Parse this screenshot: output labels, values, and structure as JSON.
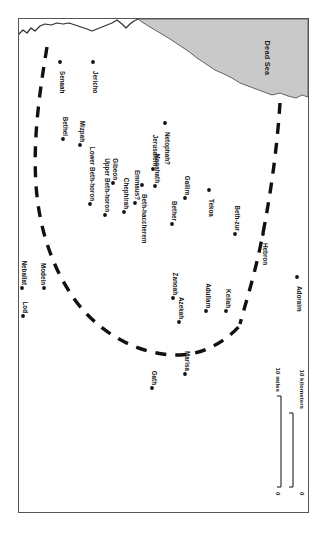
{
  "map": {
    "title": "Judah in the Persian Period",
    "orientation": "rotated-90-clockwise",
    "frame": {
      "stroke": "#4a4a4a",
      "fill": "#ffffff"
    },
    "water": {
      "name": "Dead Sea",
      "fill": "#c9c9c9",
      "stroke": "#555555"
    },
    "boundary": {
      "name": "provincial-boundary",
      "style": "dashed",
      "stroke": "#111111"
    },
    "sites": [
      {
        "name": "Senaah",
        "label": "Senaah",
        "x": 60,
        "y": 71,
        "dot_side": "right"
      },
      {
        "name": "Jericho",
        "label": "Jericho",
        "x": 93,
        "y": 73,
        "dot_side": "right"
      },
      {
        "name": "Bethel",
        "label": "Bethel",
        "x": 63,
        "y": 114,
        "dot_side": "left"
      },
      {
        "name": "Mizpah",
        "label": "Mizpah",
        "x": 80,
        "y": 117,
        "dot_side": "left"
      },
      {
        "name": "Lower Beth-horon",
        "label": "Lower Beth-horon",
        "x": 90,
        "y": 158,
        "dot_side": "left"
      },
      {
        "name": "Upper Beth-horon",
        "label": "Upper Beth-horon",
        "x": 105,
        "y": 164,
        "dot_side": "left"
      },
      {
        "name": "Gibeon",
        "label": "Gibeon",
        "x": 113,
        "y": 160,
        "dot_side": "left"
      },
      {
        "name": "Chephirah",
        "label": "Chephirah",
        "x": 124,
        "y": 173,
        "dot_side": "left"
      },
      {
        "name": "Emmaus?",
        "label": "Emmaus?",
        "x": 135,
        "y": 152,
        "dot_side": "left"
      },
      {
        "name": "Jerusalem",
        "label": "Jerusalem",
        "x": 153,
        "y": 140,
        "dot_side": "left"
      },
      {
        "name": "Manahath",
        "label": "Manahath",
        "x": 155,
        "y": 157,
        "dot_side": "left"
      },
      {
        "name": "Netophah?",
        "label": "Netophah?",
        "x": 165,
        "y": 132,
        "dot_side": "right"
      },
      {
        "name": "Beth-haccherem",
        "label": "Beth-haccherem",
        "x": 142,
        "y": 194,
        "dot_side": "right"
      },
      {
        "name": "Bether",
        "label": "Bether",
        "x": 172,
        "y": 196,
        "dot_side": "left"
      },
      {
        "name": "Gallim",
        "label": "Gallim",
        "x": 185,
        "y": 173,
        "dot_side": "left"
      },
      {
        "name": "Tekoa",
        "label": "Tekoa",
        "x": 209,
        "y": 199,
        "dot_side": "right"
      },
      {
        "name": "Beth-zur",
        "label": "Beth-zur",
        "x": 235,
        "y": 206,
        "dot_side": "left"
      },
      {
        "name": "Hebron",
        "label": "Hebron",
        "x": 263,
        "y": 243,
        "dot_side": "right"
      },
      {
        "name": "Neballat",
        "label": "Neballat",
        "x": 22,
        "y": 263,
        "dot_side": "left"
      },
      {
        "name": "Modein",
        "label": "Modein",
        "x": 44,
        "y": 258,
        "dot_side": "below"
      },
      {
        "name": "Lod",
        "label": "Lod",
        "x": 23,
        "y": 300,
        "dot_side": "left"
      },
      {
        "name": "Zanoah",
        "label": "Zanoah",
        "x": 173,
        "y": 275,
        "dot_side": "left"
      },
      {
        "name": "Azekah",
        "label": "Azekah",
        "x": 179,
        "y": 300,
        "dot_side": "left"
      },
      {
        "name": "Adullam",
        "label": "Adullam",
        "x": 206,
        "y": 283,
        "dot_side": "left"
      },
      {
        "name": "Keilah",
        "label": "Keilah",
        "x": 226,
        "y": 292,
        "dot_side": "left"
      },
      {
        "name": "Adoraim",
        "label": "Adoraim",
        "x": 297,
        "y": 286,
        "dot_side": "right"
      },
      {
        "name": "Gath",
        "label": "Gath",
        "x": 152,
        "y": 365,
        "dot_side": "left"
      },
      {
        "name": "Marisa",
        "label": "Marisa",
        "x": 185,
        "y": 351,
        "dot_side": "left"
      }
    ],
    "scale": {
      "miles_label": "10 miles",
      "kilometers_label": "10 kilometers",
      "zero_miles": "0",
      "zero_kilometers": "0"
    }
  }
}
